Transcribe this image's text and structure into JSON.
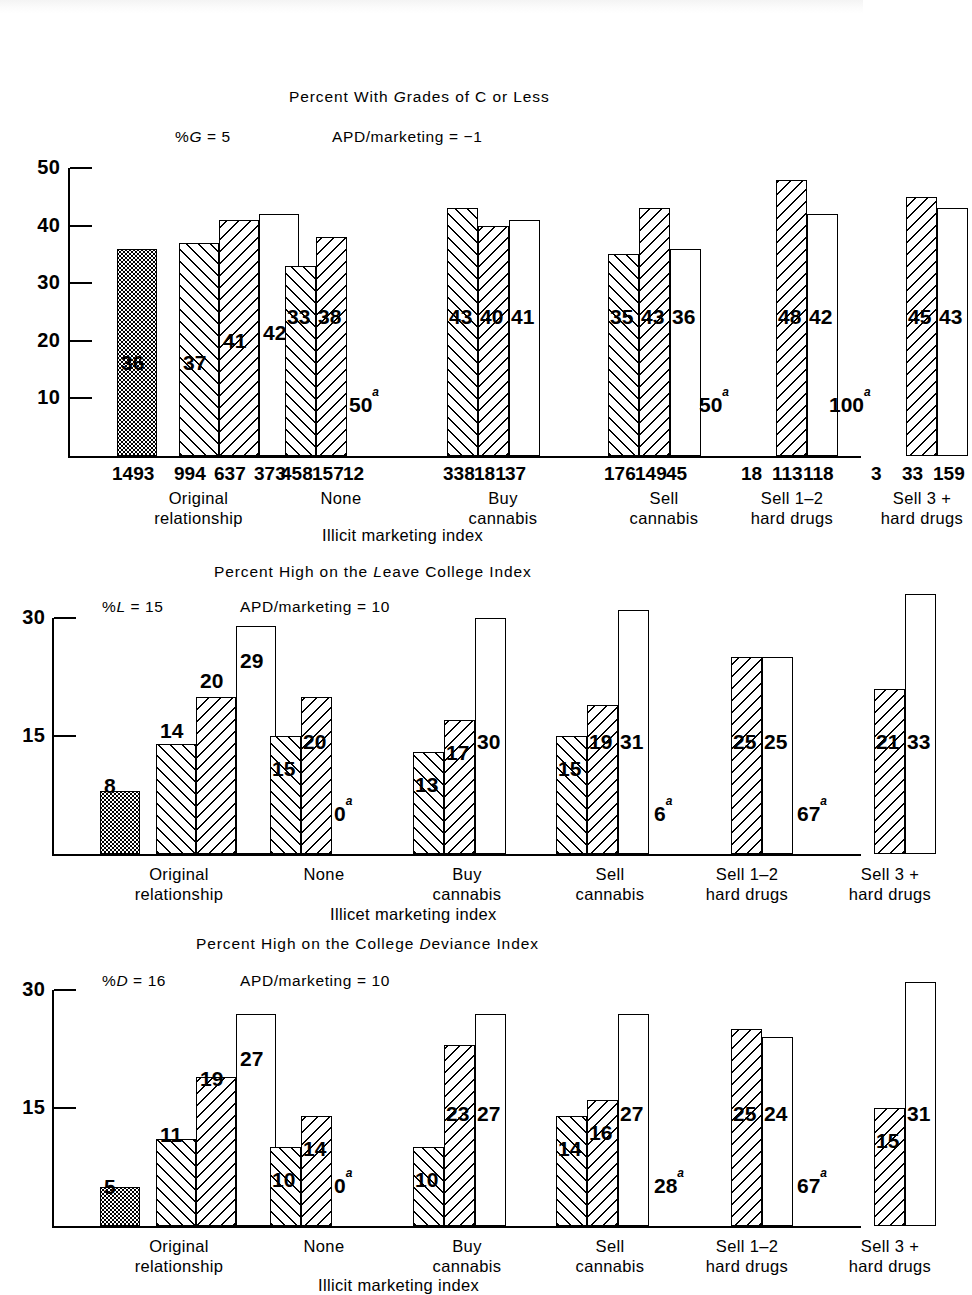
{
  "figure": {
    "background": "#ffffff",
    "ink": "#000000",
    "width": 863,
    "height": 1292
  },
  "panels": [
    {
      "id": "grades",
      "title_prefix": "Percent With ",
      "title_italic": "G",
      "title_suffix": "rades of C or Less",
      "left_annot_prefix": "%",
      "left_annot_italic": "G",
      "left_annot_suffix": " = 5",
      "right_annot": "APD/marketing = −1",
      "y_ticks": [
        "50",
        "40",
        "30",
        "20",
        "10"
      ],
      "y_max": 50,
      "left_group_caption": [
        "Original",
        "relationship"
      ],
      "x_axis_title": "Illicit marketing index",
      "left_bars": [
        {
          "value": 36,
          "label": "36",
          "pattern": "dot",
          "n": "1493",
          "drawn": true
        },
        {
          "value": 37,
          "label": "37",
          "pattern": "hatchR",
          "n": "994",
          "drawn": true
        },
        {
          "value": 41,
          "label": "41",
          "pattern": "hatchL",
          "n": "637",
          "drawn": true
        },
        {
          "value": 42,
          "label": "42",
          "pattern": "plain",
          "n": "373",
          "drawn": true
        }
      ],
      "groups": [
        {
          "caption": [
            "None"
          ],
          "bars": [
            {
              "value": 33,
              "label": "33",
              "pattern": "hatchR",
              "n": "458",
              "drawn": true
            },
            {
              "value": 38,
              "label": "38",
              "pattern": "hatchL",
              "n": "157",
              "drawn": true
            },
            {
              "value": 50,
              "label": "50",
              "sup": "a",
              "pattern": "plain",
              "n": "12",
              "drawn": false
            }
          ]
        },
        {
          "caption": [
            "Buy",
            "cannabis"
          ],
          "bars": [
            {
              "value": 43,
              "label": "43",
              "pattern": "hatchR",
              "n": "338",
              "drawn": true
            },
            {
              "value": 40,
              "label": "40",
              "pattern": "hatchL",
              "n": "181",
              "drawn": true
            },
            {
              "value": 41,
              "label": "41",
              "pattern": "plain",
              "n": "37",
              "drawn": true
            }
          ]
        },
        {
          "caption": [
            "Sell",
            "cannabis"
          ],
          "bars": [
            {
              "value": 35,
              "label": "35",
              "pattern": "hatchR",
              "n": "176",
              "drawn": true
            },
            {
              "value": 43,
              "label": "43",
              "pattern": "hatchL",
              "n": "149",
              "drawn": true
            },
            {
              "value": 36,
              "label": "36",
              "pattern": "plain",
              "n": "45",
              "drawn": true
            }
          ]
        },
        {
          "caption": [
            "Sell 1–2",
            "hard drugs"
          ],
          "bars": [
            {
              "value": 50,
              "label": "50",
              "sup": "a",
              "pattern": "hatchR",
              "n": "18",
              "drawn": false
            },
            {
              "value": 48,
              "label": "48",
              "pattern": "hatchL",
              "n": "113",
              "drawn": true
            },
            {
              "value": 42,
              "label": "42",
              "pattern": "plain",
              "n": "118",
              "drawn": true
            }
          ]
        },
        {
          "caption": [
            "Sell 3 +",
            "hard drugs"
          ],
          "bars": [
            {
              "value": 100,
              "label": "100",
              "sup": "a",
              "pattern": "hatchR",
              "n": "3",
              "drawn": false
            },
            {
              "value": 45,
              "label": "45",
              "pattern": "hatchL",
              "n": "33",
              "drawn": true
            },
            {
              "value": 43,
              "label": "43",
              "pattern": "plain",
              "n": "159",
              "drawn": true
            }
          ]
        }
      ]
    },
    {
      "id": "leave-college",
      "title_prefix": "Percent High on the ",
      "title_italic": "L",
      "title_suffix": "eave College Index",
      "left_annot_prefix": "%",
      "left_annot_italic": "L",
      "left_annot_suffix": " = 15",
      "right_annot": "APD/marketing = 10",
      "y_ticks": [
        "30",
        "15"
      ],
      "y_max": 30,
      "left_group_caption": [
        "Original",
        "relationship"
      ],
      "x_axis_title": "Illicet marketing index",
      "left_bars": [
        {
          "value": 8,
          "label": "8",
          "pattern": "dot",
          "drawn": true
        },
        {
          "value": 14,
          "label": "14",
          "pattern": "hatchR",
          "drawn": true
        },
        {
          "value": 20,
          "label": "20",
          "pattern": "hatchL",
          "drawn": true
        },
        {
          "value": 29,
          "label": "29",
          "pattern": "plain",
          "drawn": true
        }
      ],
      "groups": [
        {
          "caption": [
            "None"
          ],
          "bars": [
            {
              "value": 15,
              "label": "15",
              "pattern": "hatchR",
              "drawn": true
            },
            {
              "value": 20,
              "label": "20",
              "pattern": "hatchL",
              "drawn": true
            },
            {
              "value": 0,
              "label": "0",
              "sup": "a",
              "pattern": "plain",
              "drawn": false
            }
          ]
        },
        {
          "caption": [
            "Buy",
            "cannabis"
          ],
          "bars": [
            {
              "value": 13,
              "label": "13",
              "pattern": "hatchR",
              "drawn": true
            },
            {
              "value": 17,
              "label": "17",
              "pattern": "hatchL",
              "drawn": true
            },
            {
              "value": 30,
              "label": "30",
              "pattern": "plain",
              "drawn": true
            }
          ]
        },
        {
          "caption": [
            "Sell",
            "cannabis"
          ],
          "bars": [
            {
              "value": 15,
              "label": "15",
              "pattern": "hatchR",
              "drawn": true
            },
            {
              "value": 19,
              "label": "19",
              "pattern": "hatchL",
              "drawn": true
            },
            {
              "value": 31,
              "label": "31",
              "pattern": "plain",
              "drawn": true
            }
          ]
        },
        {
          "caption": [
            "Sell 1–2",
            "hard drugs"
          ],
          "bars": [
            {
              "value": 6,
              "label": "6",
              "sup": "a",
              "pattern": "hatchR",
              "drawn": false
            },
            {
              "value": 25,
              "label": "25",
              "pattern": "hatchL",
              "drawn": true
            },
            {
              "value": 25,
              "label": "25",
              "pattern": "plain",
              "drawn": true
            }
          ]
        },
        {
          "caption": [
            "Sell 3 +",
            "hard drugs"
          ],
          "bars": [
            {
              "value": 67,
              "label": "67",
              "sup": "a",
              "pattern": "hatchR",
              "drawn": false
            },
            {
              "value": 21,
              "label": "21",
              "pattern": "hatchL",
              "drawn": true
            },
            {
              "value": 33,
              "label": "33",
              "pattern": "plain",
              "drawn": true
            }
          ]
        }
      ]
    },
    {
      "id": "college-deviance",
      "title_prefix": "Percent High on the College ",
      "title_italic": "D",
      "title_suffix": "eviance Index",
      "left_annot_prefix": "%",
      "left_annot_italic": "D",
      "left_annot_suffix": " = 16",
      "right_annot": "APD/marketing = 10",
      "y_ticks": [
        "30",
        "15"
      ],
      "y_max": 30,
      "left_group_caption": [
        "Original",
        "relationship"
      ],
      "x_axis_title": "Illicit marketing index",
      "left_bars": [
        {
          "value": 5,
          "label": "5",
          "pattern": "dot",
          "drawn": true
        },
        {
          "value": 11,
          "label": "11",
          "pattern": "hatchR",
          "drawn": true
        },
        {
          "value": 19,
          "label": "19",
          "pattern": "hatchL",
          "drawn": true
        },
        {
          "value": 27,
          "label": "27",
          "pattern": "plain",
          "drawn": true
        }
      ],
      "groups": [
        {
          "caption": [
            "None"
          ],
          "bars": [
            {
              "value": 10,
              "label": "10",
              "pattern": "hatchR",
              "drawn": true
            },
            {
              "value": 14,
              "label": "14",
              "pattern": "hatchL",
              "drawn": true
            },
            {
              "value": 0,
              "label": "0",
              "sup": "a",
              "pattern": "plain",
              "drawn": false
            }
          ]
        },
        {
          "caption": [
            "Buy",
            "cannabis"
          ],
          "bars": [
            {
              "value": 10,
              "label": "10",
              "pattern": "hatchR",
              "drawn": true
            },
            {
              "value": 23,
              "label": "23",
              "pattern": "hatchL",
              "drawn": true
            },
            {
              "value": 27,
              "label": "27",
              "pattern": "plain",
              "drawn": true
            }
          ]
        },
        {
          "caption": [
            "Sell",
            "cannabis"
          ],
          "bars": [
            {
              "value": 14,
              "label": "14",
              "pattern": "hatchR",
              "drawn": true
            },
            {
              "value": 16,
              "label": "16",
              "pattern": "hatchL",
              "drawn": true
            },
            {
              "value": 27,
              "label": "27",
              "pattern": "plain",
              "drawn": true
            }
          ]
        },
        {
          "caption": [
            "Sell 1–2",
            "hard drugs"
          ],
          "bars": [
            {
              "value": 28,
              "label": "28",
              "sup": "a",
              "pattern": "hatchR",
              "drawn": false
            },
            {
              "value": 25,
              "label": "25",
              "pattern": "hatchL",
              "drawn": true
            },
            {
              "value": 24,
              "label": "24",
              "pattern": "plain",
              "drawn": true
            }
          ]
        },
        {
          "caption": [
            "Sell 3 +",
            "hard drugs"
          ],
          "bars": [
            {
              "value": 67,
              "label": "67",
              "sup": "a",
              "pattern": "hatchR",
              "drawn": false
            },
            {
              "value": 15,
              "label": "15",
              "pattern": "hatchL",
              "drawn": true
            },
            {
              "value": 31,
              "label": "31",
              "pattern": "plain",
              "drawn": true
            }
          ]
        }
      ]
    }
  ],
  "chart_data": {
    "type": "bar",
    "grid": false,
    "legend_position": "none",
    "charts": [
      {
        "type": "bar",
        "title": "Percent With Grades of C or Less",
        "ylabel": "",
        "xlabel": "Illicit marketing index",
        "ylim": [
          0,
          50
        ],
        "yticks": [
          10,
          20,
          30,
          40,
          50
        ],
        "annotations": [
          "%G = 5",
          "APD/marketing = -1"
        ],
        "left_panel": {
          "label": "Original relationship",
          "categories": [
            "1493",
            "994",
            "637",
            "373"
          ],
          "values": [
            36,
            37,
            41,
            42
          ],
          "patterns": [
            "dotted",
            "hatch-right",
            "hatch-left",
            "open"
          ]
        },
        "categories": [
          "None",
          "Buy cannabis",
          "Sell cannabis",
          "Sell 1-2 hard drugs",
          "Sell 3 + hard drugs"
        ],
        "series": [
          {
            "name": "hatch-right",
            "values": [
              33,
              43,
              35,
              50,
              100
            ],
            "n": [
              458,
              338,
              176,
              18,
              3
            ],
            "suppressed": [
              false,
              false,
              false,
              true,
              true
            ]
          },
          {
            "name": "hatch-left",
            "values": [
              38,
              40,
              43,
              48,
              45
            ],
            "n": [
              157,
              181,
              149,
              113,
              33
            ],
            "suppressed": [
              false,
              false,
              false,
              false,
              false
            ]
          },
          {
            "name": "open",
            "values": [
              50,
              41,
              36,
              42,
              43
            ],
            "n": [
              12,
              37,
              45,
              118,
              159
            ],
            "suppressed": [
              true,
              false,
              false,
              false,
              false
            ]
          }
        ]
      },
      {
        "type": "bar",
        "title": "Percent High on the Leave College Index",
        "ylabel": "",
        "xlabel": "Illicet marketing index",
        "ylim": [
          0,
          30
        ],
        "yticks": [
          15,
          30
        ],
        "annotations": [
          "%L = 15",
          "APD/marketing = 10"
        ],
        "left_panel": {
          "label": "Original relationship",
          "categories": [
            "",
            "",
            "",
            ""
          ],
          "values": [
            8,
            14,
            20,
            29
          ],
          "patterns": [
            "dotted",
            "hatch-right",
            "hatch-left",
            "open"
          ]
        },
        "categories": [
          "None",
          "Buy cannabis",
          "Sell cannabis",
          "Sell 1-2 hard drugs",
          "Sell 3 + hard drugs"
        ],
        "series": [
          {
            "name": "hatch-right",
            "values": [
              15,
              13,
              15,
              6,
              67
            ],
            "suppressed": [
              false,
              false,
              false,
              true,
              true
            ]
          },
          {
            "name": "hatch-left",
            "values": [
              20,
              17,
              19,
              25,
              21
            ],
            "suppressed": [
              false,
              false,
              false,
              false,
              false
            ]
          },
          {
            "name": "open",
            "values": [
              0,
              30,
              31,
              25,
              33
            ],
            "suppressed": [
              true,
              false,
              false,
              false,
              false
            ]
          }
        ]
      },
      {
        "type": "bar",
        "title": "Percent High on the College Deviance Index",
        "ylabel": "",
        "xlabel": "Illicit marketing index",
        "ylim": [
          0,
          30
        ],
        "yticks": [
          15,
          30
        ],
        "annotations": [
          "%D = 16",
          "APD/marketing = 10"
        ],
        "left_panel": {
          "label": "Original relationship",
          "categories": [
            "",
            "",
            "",
            ""
          ],
          "values": [
            5,
            11,
            19,
            27
          ],
          "patterns": [
            "dotted",
            "hatch-right",
            "hatch-left",
            "open"
          ]
        },
        "categories": [
          "None",
          "Buy cannabis",
          "Sell cannabis",
          "Sell 1-2 hard drugs",
          "Sell 3 + hard drugs"
        ],
        "series": [
          {
            "name": "hatch-right",
            "values": [
              10,
              10,
              14,
              28,
              67
            ],
            "suppressed": [
              false,
              false,
              false,
              true,
              true
            ]
          },
          {
            "name": "hatch-left",
            "values": [
              14,
              23,
              16,
              25,
              15
            ],
            "suppressed": [
              false,
              false,
              false,
              false,
              false
            ]
          },
          {
            "name": "open",
            "values": [
              0,
              27,
              27,
              24,
              31
            ],
            "suppressed": [
              true,
              false,
              false,
              false,
              false
            ]
          }
        ]
      }
    ]
  }
}
